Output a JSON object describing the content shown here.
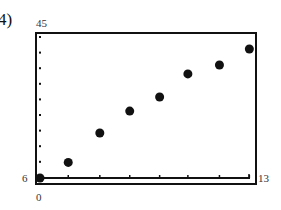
{
  "part_label": "4)",
  "window": {
    "xmin_label": "0",
    "xmax_label": "13",
    "ymin_label": "6",
    "ymax_label": "45"
  },
  "colors": {
    "ink": "#111111",
    "label": "#333333",
    "background": "#ffffff"
  },
  "chart_data": {
    "type": "scatter",
    "title": "",
    "xlabel": "",
    "ylabel": "",
    "xlim": [
      0,
      13
    ],
    "ylim": [
      6,
      45
    ],
    "grid": false,
    "legend": null,
    "points": [
      {
        "x": 0,
        "y": 6
      },
      {
        "x": 1.7,
        "y": 10.2
      },
      {
        "x": 3.6,
        "y": 18.1
      },
      {
        "x": 5.4,
        "y": 24.0
      },
      {
        "x": 7.2,
        "y": 27.8
      },
      {
        "x": 8.9,
        "y": 34.0
      },
      {
        "x": 10.8,
        "y": 36.4
      },
      {
        "x": 12.6,
        "y": 40.7
      }
    ],
    "x_ticks_count": 7,
    "y_ticks_count": 9,
    "annotations": [
      "Xmin 0",
      "Xmax 13",
      "Ymin 6",
      "Ymax 45"
    ]
  }
}
